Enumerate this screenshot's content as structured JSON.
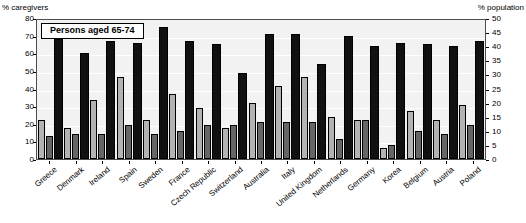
{
  "axes": {
    "left_caption": "% caregivers",
    "right_caption": "% population",
    "left_ticks": [
      "80",
      "70",
      "60",
      "50",
      "40",
      "30",
      "20",
      "10",
      "0"
    ],
    "right_ticks": [
      "50",
      "45",
      "40",
      "35",
      "30",
      "25",
      "20",
      "15",
      "10",
      "5",
      "0"
    ]
  },
  "title_box": "Persons aged 65-74",
  "chart_data": {
    "type": "bar",
    "title": "Persons aged 65-74",
    "xlabel": "",
    "ylabel": "% caregivers",
    "y2label": "% population",
    "ylim": [
      0,
      80
    ],
    "y2lim": [
      0,
      50
    ],
    "grid": true,
    "legend": "none",
    "categories": [
      "Greece",
      "Denmark",
      "Ireland",
      "Spain",
      "Sweden",
      "France",
      "Czech Republic",
      "Switzerland",
      "Australia",
      "Italy",
      "United Kingdom",
      "Netherlands",
      "Germany",
      "Korea",
      "Belgium",
      "Austria",
      "Poland"
    ],
    "series": [
      {
        "name": "light-grey bar",
        "color": "#b3b3b3",
        "axis": "right",
        "values": [
          14,
          11,
          21,
          29,
          14,
          23,
          18,
          11,
          20,
          26,
          29,
          15,
          14,
          4,
          17,
          14,
          19
        ]
      },
      {
        "name": "mid-grey bar",
        "color": "#666666",
        "axis": "right",
        "values": [
          8,
          9,
          9,
          12,
          9,
          10,
          12,
          12,
          13,
          13,
          13,
          7,
          14,
          5,
          10,
          9,
          12
        ]
      },
      {
        "name": "black bar",
        "color": "#111111",
        "axis": "left",
        "values": [
          68,
          60,
          67,
          66,
          75,
          67,
          65,
          49,
          71,
          71,
          54,
          70,
          64,
          66,
          65,
          64,
          67
        ]
      }
    ]
  }
}
